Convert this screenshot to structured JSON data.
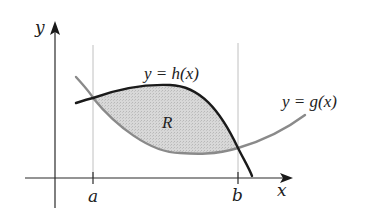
{
  "diagram": {
    "axes": {
      "x_label": "x",
      "y_label": "y"
    },
    "bounds": {
      "left_label": "a",
      "right_label": "b"
    },
    "curves": [
      {
        "id": "h",
        "label": "y = h(x)",
        "color": "#1a1a1a",
        "role": "upper"
      },
      {
        "id": "g",
        "label": "y = g(x)",
        "color": "#8a8a8a",
        "role": "lower"
      }
    ],
    "region": {
      "label": "R",
      "fill": "#d6d6d6"
    }
  }
}
